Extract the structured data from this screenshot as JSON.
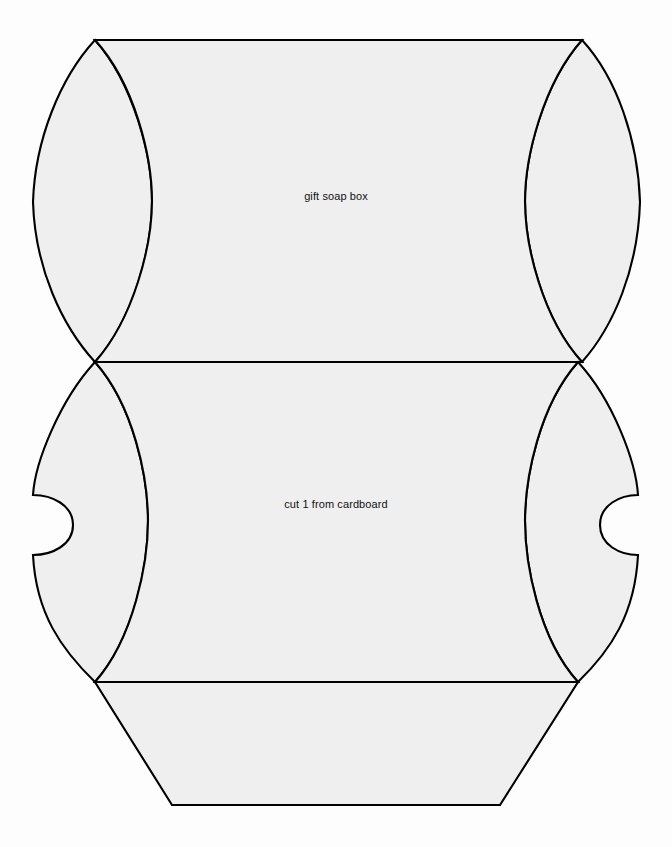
{
  "document": {
    "kind": "cutting-template",
    "canvas": {
      "width": 672,
      "height": 847
    },
    "background_color": "#fdfdfd",
    "paper_fill_color": "#efefef",
    "line_color": "#000000"
  },
  "labels": {
    "top_panel": "gift soap box",
    "bottom_panel": "cut 1 from cardboard"
  },
  "geometry": {
    "top_edge_y": 40,
    "middle_fold_y": 362,
    "lower_fold_y": 682,
    "bottom_edge_y": 805,
    "left_corner_x": 95,
    "right_corner_x": 582,
    "left_outer_extent_x": 33,
    "right_outer_extent_x": 640,
    "bottom_left_x": 172,
    "bottom_right_x": 500,
    "notch_top_y": 495,
    "notch_bottom_y": 555,
    "left_notch_depth_x": 73,
    "right_notch_depth_x": 600
  }
}
